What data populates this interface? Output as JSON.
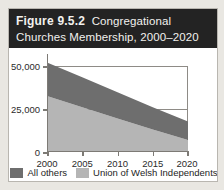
{
  "figure": {
    "number_label": "Figure 9.5.2",
    "caption": "Congregational",
    "caption_line2": "Churches Membership, 2000–2020"
  },
  "colors": {
    "header_background": "#232323",
    "header_text": "#f2f1ee",
    "card_background": "#ffffff",
    "page_background": "#e9e7e2",
    "series_all_others": "#6e6e6e",
    "series_union_welsh": "#b5b5b5",
    "axis": "#7d7a75",
    "gridline": "#8e8b86",
    "tick_text": "#2b2b2b"
  },
  "chart_data": {
    "type": "area",
    "stacked": true,
    "xlabel": "",
    "ylabel": "",
    "x": [
      2000,
      2005,
      2010,
      2015,
      2020
    ],
    "xtick_labels": [
      "2000",
      "2005",
      "2010",
      "2015",
      "2020"
    ],
    "ytick_labels": [
      "0",
      "25,000",
      "50,000"
    ],
    "ytick_values": [
      0,
      25000,
      50000
    ],
    "ylim": [
      0,
      62500
    ],
    "xlim": [
      2000,
      2020
    ],
    "grid": true,
    "legend_position": "bottom",
    "series": [
      {
        "name": "Union of Welsh Independents",
        "color": "#b5b5b5",
        "values": [
          35000,
          28000,
          21000,
          14000,
          7500
        ]
      },
      {
        "name": "All others",
        "color": "#6e6e6e",
        "values": [
          21000,
          18700,
          16400,
          14000,
          11500
        ]
      }
    ],
    "totals": [
      56000,
      46700,
      37400,
      28000,
      19000
    ]
  },
  "legend": {
    "entries": [
      {
        "label": "All others",
        "color": "#6e6e6e"
      },
      {
        "label": "Union of Welsh Independents",
        "color": "#b5b5b5"
      }
    ]
  }
}
